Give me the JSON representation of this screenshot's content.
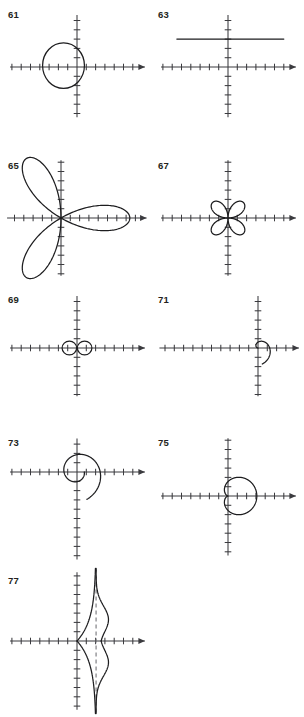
{
  "page": {
    "kind": "answer-key-figure-set",
    "background_color": "#ffffff",
    "ink_color": "#1d1d1f",
    "axis_color": "#3b3b3f",
    "asymptote_color": "#6f6f74",
    "width": 304,
    "height": 717
  },
  "panels": [
    {
      "id": "panel-61",
      "label": "61",
      "label_x": 8,
      "label_y": 10,
      "box": {
        "x": 6,
        "y": 6,
        "w": 146,
        "h": 114
      },
      "origin": {
        "x": 77,
        "y": 67
      },
      "unit": 9.3,
      "x_axis": {
        "x_min": -7.2,
        "x_max": 7.3,
        "arrow": "right"
      },
      "y_axis": {
        "y_min": -5.4,
        "y_max": 5.6,
        "arrow": "none"
      },
      "x_ticks": [
        -7,
        -6,
        -5,
        -4,
        -3,
        -2,
        -1,
        1,
        2,
        3,
        4,
        5,
        6
      ],
      "y_ticks": [
        -5,
        -4,
        -3,
        -2,
        -1,
        1,
        2,
        3,
        4,
        5
      ],
      "curve_type": "circle",
      "curve": {
        "cx": -1.45,
        "cy": 0.15,
        "rx": 2.25,
        "ry": 2.45
      },
      "description": "circle centered left of origin"
    },
    {
      "id": "panel-63",
      "label": "63",
      "label_x": 158,
      "label_y": 10,
      "box": {
        "x": 156,
        "y": 6,
        "w": 146,
        "h": 114
      },
      "origin": {
        "x": 228,
        "y": 67
      },
      "unit": 9.3,
      "x_axis": {
        "x_min": -7.2,
        "x_max": 7.3,
        "arrow": "right"
      },
      "y_axis": {
        "y_min": -5.4,
        "y_max": 5.6,
        "arrow": "none"
      },
      "x_ticks": [
        -7,
        -6,
        -5,
        -4,
        -3,
        -2,
        -1,
        1,
        2,
        3,
        4,
        5,
        6
      ],
      "y_ticks": [
        -5,
        -4,
        -3,
        -2,
        -1,
        1,
        2,
        3,
        4,
        5
      ],
      "curve_type": "segment",
      "curve": {
        "x1": -5.5,
        "y1": 3.0,
        "x2": 6.0,
        "y2": 3.0
      },
      "description": "horizontal line y = 3"
    },
    {
      "id": "panel-65",
      "label": "65",
      "label_x": 8,
      "label_y": 161,
      "box": {
        "x": 6,
        "y": 155,
        "w": 146,
        "h": 124
      },
      "origin": {
        "x": 61,
        "y": 218
      },
      "unit": 9.3,
      "x_axis": {
        "x_min": -5.8,
        "x_max": 9.2,
        "arrow": "right"
      },
      "y_axis": {
        "y_min": -6.2,
        "y_max": 6.2,
        "arrow": "none"
      },
      "x_ticks": [
        -5,
        -4,
        -3,
        -2,
        -1,
        1,
        2,
        3,
        4,
        5,
        6,
        7,
        8
      ],
      "y_ticks": [
        -6,
        -5,
        -4,
        -3,
        -2,
        -1,
        1,
        2,
        3,
        4,
        5,
        6
      ],
      "curve_type": "rose",
      "curve": {
        "petals": 3,
        "amplitude": 7.4,
        "k": 3,
        "phase_deg": 0,
        "rotation_deg": 0
      },
      "description": "three-petaled rose r = a cos 3θ"
    },
    {
      "id": "panel-67",
      "label": "67",
      "label_x": 158,
      "label_y": 161,
      "box": {
        "x": 156,
        "y": 155,
        "w": 146,
        "h": 124
      },
      "origin": {
        "x": 228,
        "y": 218
      },
      "unit": 9.3,
      "x_axis": {
        "x_min": -7.2,
        "x_max": 7.3,
        "arrow": "right"
      },
      "y_axis": {
        "y_min": -6.2,
        "y_max": 6.2,
        "arrow": "none"
      },
      "x_ticks": [
        -7,
        -6,
        -5,
        -4,
        -3,
        -2,
        -1,
        1,
        2,
        3,
        4,
        5,
        6
      ],
      "y_ticks": [
        -6,
        -5,
        -4,
        -3,
        -2,
        -1,
        1,
        2,
        3,
        4,
        5,
        6
      ],
      "curve_type": "rose",
      "curve": {
        "petals": 4,
        "amplitude": 2.35,
        "k": 2,
        "phase_deg": 0,
        "rotation_deg": 45
      },
      "description": "four-petaled rose, petals on the diagonals"
    },
    {
      "id": "panel-69",
      "label": "69",
      "label_x": 8,
      "label_y": 295,
      "box": {
        "x": 6,
        "y": 289,
        "w": 146,
        "h": 110
      },
      "origin": {
        "x": 77,
        "y": 348
      },
      "unit": 9.3,
      "x_axis": {
        "x_min": -7.2,
        "x_max": 7.3,
        "arrow": "right"
      },
      "y_axis": {
        "y_min": -5.2,
        "y_max": 5.6,
        "arrow": "none"
      },
      "x_ticks": [
        -7,
        -6,
        -5,
        -4,
        -3,
        -2,
        -1,
        1,
        2,
        3,
        4,
        5,
        6
      ],
      "y_ticks": [
        -5,
        -4,
        -3,
        -2,
        -1,
        1,
        2,
        3,
        4,
        5
      ],
      "curve_type": "lemniscate-circles",
      "curve": {
        "r": 0.78,
        "left_cx": -0.82,
        "right_cx": 0.82,
        "cy": 0
      },
      "description": "two small tangent circles at the origin"
    },
    {
      "id": "panel-71",
      "label": "71",
      "label_x": 158,
      "label_y": 295,
      "box": {
        "x": 156,
        "y": 289,
        "w": 146,
        "h": 110
      },
      "origin": {
        "x": 258,
        "y": 348
      },
      "unit": 9.3,
      "x_axis": {
        "x_min": -10.6,
        "x_max": 4.4,
        "arrow": "right"
      },
      "y_axis": {
        "y_min": -5.2,
        "y_max": 5.6,
        "arrow": "none"
      },
      "x_ticks": [
        -10,
        -9,
        -8,
        -7,
        -6,
        -5,
        -4,
        -3,
        -2,
        -1,
        1,
        2,
        3
      ],
      "y_ticks": [
        -5,
        -4,
        -3,
        -2,
        -1,
        1,
        2,
        3,
        4,
        5
      ],
      "curve_type": "spiral",
      "curve": {
        "a": 0.4,
        "theta_start_deg": 0,
        "theta_end_deg": 255,
        "direction": "ccw"
      },
      "description": "spiral of Archimedes, partial arc"
    },
    {
      "id": "panel-73",
      "label": "73",
      "label_x": 8,
      "label_y": 438,
      "box": {
        "x": 6,
        "y": 432,
        "w": 146,
        "h": 132
      },
      "origin": {
        "x": 77,
        "y": 472
      },
      "unit": 9.3,
      "x_axis": {
        "x_min": -7.2,
        "x_max": 7.3,
        "arrow": "right"
      },
      "y_axis": {
        "y_min": -9.4,
        "y_max": 3.6,
        "arrow": "none"
      },
      "x_ticks": [
        -7,
        -6,
        -5,
        -4,
        -3,
        -2,
        -1,
        1,
        2,
        3,
        4,
        5,
        6
      ],
      "y_ticks": [
        -9,
        -8,
        -7,
        -6,
        -5,
        -4,
        -3,
        -2,
        -1,
        1,
        2,
        3
      ],
      "curve_type": "log-spiral",
      "curve": {
        "a": 0.78,
        "b": 0.185,
        "theta_start_deg": 0,
        "theta_end_deg": 430
      },
      "description": "logarithmic spiral winding outward clockwise"
    },
    {
      "id": "panel-75",
      "label": "75",
      "label_x": 158,
      "label_y": 438,
      "box": {
        "x": 156,
        "y": 432,
        "w": 146,
        "h": 132
      },
      "origin": {
        "x": 228,
        "y": 496
      },
      "unit": 9.3,
      "x_axis": {
        "x_min": -7.2,
        "x_max": 7.3,
        "arrow": "right"
      },
      "y_axis": {
        "y_min": -6.4,
        "y_max": 6.2,
        "arrow": "none"
      },
      "x_ticks": [
        -7,
        -6,
        -5,
        -4,
        -3,
        -2,
        -1,
        1,
        2,
        3,
        4,
        5,
        6
      ],
      "y_ticks": [
        -6,
        -5,
        -4,
        -3,
        -2,
        -1,
        1,
        2,
        3,
        4,
        5,
        6
      ],
      "curve_type": "cardioid",
      "curve": {
        "a": 3.1,
        "direction_deg": 180
      },
      "description": "cardioid opening to the left, cusp at the origin"
    },
    {
      "id": "panel-77",
      "label": "77",
      "label_x": 8,
      "label_y": 576,
      "box": {
        "x": 6,
        "y": 570,
        "w": 146,
        "h": 142
      },
      "origin": {
        "x": 77,
        "y": 641
      },
      "unit": 9.3,
      "x_axis": {
        "x_min": -7.2,
        "x_max": 7.3,
        "arrow": "right"
      },
      "y_axis": {
        "y_min": -7.4,
        "y_max": 7.4,
        "arrow": "none"
      },
      "x_ticks": [
        -7,
        -6,
        -5,
        -4,
        -3,
        -2,
        -1,
        1,
        2,
        3,
        4,
        5,
        6
      ],
      "y_ticks": [
        -7,
        -6,
        -5,
        -4,
        -3,
        -2,
        -1,
        1,
        2,
        3,
        4,
        5,
        6,
        7
      ],
      "curve_type": "conchoid-asymptote",
      "curve": {
        "asymptote_x": 2.05,
        "max_abs_y": 7.8,
        "waist_x": 3.35
      },
      "description": "curve with vertical dashed asymptote at x = 2, two branches"
    }
  ]
}
